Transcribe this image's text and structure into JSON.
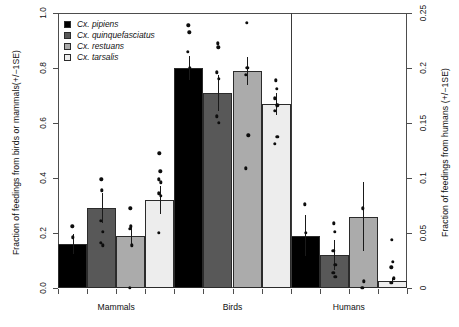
{
  "chart_data": {
    "type": "bar",
    "title": "",
    "categories": [
      "Mammals",
      "Birds",
      "Humans"
    ],
    "series": [
      {
        "name": "Cx. pipiens",
        "color": "#000000",
        "values": [
          0.16,
          0.8,
          0.19
        ]
      },
      {
        "name": "Cx. quinquefasciatus",
        "color": "#585858",
        "values": [
          0.29,
          0.71,
          0.12
        ]
      },
      {
        "name": "Cx. restuans",
        "color": "#ababab",
        "values": [
          0.19,
          0.79,
          0.26
        ]
      },
      {
        "name": "Cx. tarsalis",
        "color": "#ededed",
        "values": [
          0.32,
          0.67,
          0.025
        ]
      }
    ],
    "errors": [
      [
        0.035,
        0.045,
        0.075
      ],
      [
        0.055,
        0.065,
        0.055
      ],
      [
        0.03,
        0.05,
        0.125
      ],
      [
        0.05,
        0.04,
        0.01
      ]
    ],
    "points": [
      [
        [
          0.225,
          0.185
        ],
        [
          0.955,
          0.93,
          0.86,
          0.8
        ],
        [
          0.305,
          0.2
        ]
      ],
      [
        [
          0.395,
          0.355,
          0.245,
          0.205,
          0.165,
          0.155
        ],
        [
          0.89,
          0.875,
          0.785,
          0.76,
          0.625,
          0.6
        ],
        [
          0.235,
          0.205,
          0.135,
          0.085,
          0.055,
          0.04
        ]
      ],
      [
        [
          0.29,
          0.225,
          0.215,
          0.155,
          0.0
        ],
        [
          0.965,
          0.8,
          0.775,
          0.555,
          0.435
        ],
        [
          0.29,
          0.025,
          0.0
        ]
      ],
      [
        [
          0.49,
          0.425,
          0.395,
          0.385,
          0.345,
          0.335,
          0.2
        ],
        [
          0.755,
          0.725,
          0.69,
          0.665,
          0.645,
          0.55,
          0.525
        ],
        [
          0.175,
          0.095,
          0.075,
          0.035,
          0.02
        ]
      ]
    ],
    "left_axis": {
      "label": "Fraction of feedings from birds or mammals(+/−1SE)",
      "ticks": [
        "0.0",
        "0.2",
        "0.4",
        "0.6",
        "0.8",
        "1.0"
      ],
      "min": 0.0,
      "max": 1.0
    },
    "right_axis": {
      "label": "Fraction of feedings from humans (+/−1SE)",
      "ticks": [
        "0",
        "0.05",
        "0.1",
        "0.15",
        "0.2",
        "0.25"
      ],
      "min": 0.0,
      "max": 0.25
    },
    "xlabel": "",
    "grid": false,
    "legend_position": "top-left",
    "divider_after_group": 2
  }
}
